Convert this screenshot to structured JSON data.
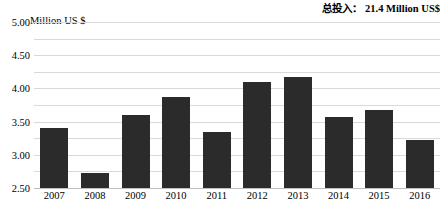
{
  "header": {
    "total_label": "总投入：",
    "total_value": "21.4 Million US$"
  },
  "axis": {
    "unit_caption": "Million US $",
    "y_ticks": [
      "5.00",
      "4.50",
      "4.00",
      "3.50",
      "3.00",
      "2.50",
      "2.00",
      "1.50",
      "1.00",
      "0.50",
      "0.00"
    ]
  },
  "colors": {
    "bar": "#2b2b2b",
    "grid": "#d9d9d9",
    "text": "#000000"
  },
  "chart_data": {
    "type": "bar",
    "title": "",
    "subtitle": "",
    "xlabel": "",
    "ylabel": "Million US $",
    "ylim": [
      0,
      5
    ],
    "ytick_step": 0.5,
    "grid": true,
    "legend": "none",
    "annotation": "总投入：21.4 Million US$",
    "categories": [
      "2007",
      "2008",
      "2009",
      "2010",
      "2011",
      "2012",
      "2013",
      "2014",
      "2015",
      "2016"
    ],
    "values": [
      1.8,
      0.45,
      2.2,
      2.75,
      1.7,
      3.2,
      3.35,
      2.15,
      2.35,
      1.45
    ]
  }
}
